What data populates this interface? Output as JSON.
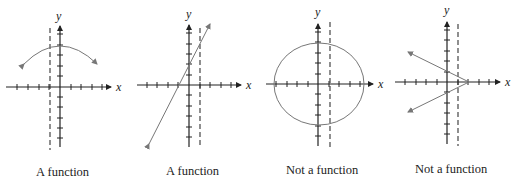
{
  "figure": {
    "panels": [
      {
        "id": "panel-1",
        "caption": "A function",
        "x_label": "x",
        "y_label": "y",
        "graph": "downward arc (parabola-like)",
        "vertical_line_test": "dashed line crosses once"
      },
      {
        "id": "panel-2",
        "caption": "A function",
        "x_label": "x",
        "y_label": "y",
        "graph": "straight line with positive slope",
        "vertical_line_test": "dashed line crosses once"
      },
      {
        "id": "panel-3",
        "caption": "Not a function",
        "x_label": "x",
        "y_label": "y",
        "graph": "circle centered at origin",
        "vertical_line_test": "dashed line crosses twice"
      },
      {
        "id": "panel-4",
        "caption": "Not a function",
        "x_label": "x",
        "y_label": "y",
        "graph": "sideways V opening left",
        "vertical_line_test": "dashed line crosses twice"
      }
    ]
  },
  "colors": {
    "axis": "#222222",
    "curve": "#777777",
    "background": "#ffffff"
  }
}
